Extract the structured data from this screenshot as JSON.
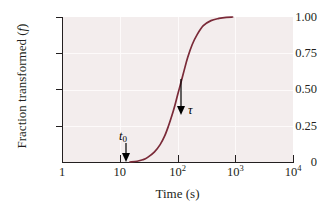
{
  "chart_data": {
    "type": "line",
    "title": "",
    "xlabel": "Time (s)",
    "ylabel": "Fraction transformed (f)",
    "ylabel_text": "Fraction transformed (",
    "ylabel_symbol": "f",
    "ylabel_suffix": ")",
    "xscale": "log",
    "xlim": [
      1,
      10000
    ],
    "ylim": [
      0,
      1.0
    ],
    "grid": true,
    "legend": "none",
    "xticks": [
      {
        "value": 1,
        "label": "1",
        "mantissa": "1",
        "exponent": ""
      },
      {
        "value": 10,
        "label": "10",
        "mantissa": "10",
        "exponent": ""
      },
      {
        "value": 100,
        "label": "10^2",
        "mantissa": "10",
        "exponent": "2"
      },
      {
        "value": 1000,
        "label": "10^3",
        "mantissa": "10",
        "exponent": "3"
      },
      {
        "value": 10000,
        "label": "10^4",
        "mantissa": "10",
        "exponent": "4"
      }
    ],
    "yticks": [
      {
        "value": 1.0,
        "label": "1.00"
      },
      {
        "value": 0.75,
        "label": "0.75"
      },
      {
        "value": 0.5,
        "label": "0.50"
      },
      {
        "value": 0.25,
        "label": "0.25"
      },
      {
        "value": 0,
        "label": "0"
      }
    ],
    "series": [
      {
        "name": "fraction transformed",
        "color": "#7a2a38",
        "points": [
          {
            "x": 15,
            "y": 0.0
          },
          {
            "x": 20,
            "y": 0.005
          },
          {
            "x": 25,
            "y": 0.015
          },
          {
            "x": 30,
            "y": 0.03
          },
          {
            "x": 40,
            "y": 0.07
          },
          {
            "x": 50,
            "y": 0.12
          },
          {
            "x": 60,
            "y": 0.18
          },
          {
            "x": 70,
            "y": 0.25
          },
          {
            "x": 80,
            "y": 0.32
          },
          {
            "x": 90,
            "y": 0.39
          },
          {
            "x": 100,
            "y": 0.46
          },
          {
            "x": 115,
            "y": 0.55
          },
          {
            "x": 130,
            "y": 0.63
          },
          {
            "x": 150,
            "y": 0.72
          },
          {
            "x": 180,
            "y": 0.81
          },
          {
            "x": 220,
            "y": 0.88
          },
          {
            "x": 280,
            "y": 0.94
          },
          {
            "x": 380,
            "y": 0.975
          },
          {
            "x": 520,
            "y": 0.99
          },
          {
            "x": 700,
            "y": 0.998
          },
          {
            "x": 900,
            "y": 1.0
          }
        ]
      }
    ],
    "annotations": [
      {
        "name": "t0",
        "symbol": "t",
        "subscript": "0",
        "x_value": 16,
        "y_value": 0.0,
        "description": "incubation time arrow pointing to curve onset"
      },
      {
        "name": "tau",
        "symbol": "τ",
        "subscript": "",
        "x_value": 115,
        "y_value": 0.5,
        "description": "time constant arrow pointing to 50% transformation"
      }
    ],
    "colors": {
      "curve": "#7a2a38",
      "plot_background": "#f3eded",
      "gridline": "#fdfafa",
      "axis": "#231f20",
      "annotation": "#000000"
    }
  }
}
